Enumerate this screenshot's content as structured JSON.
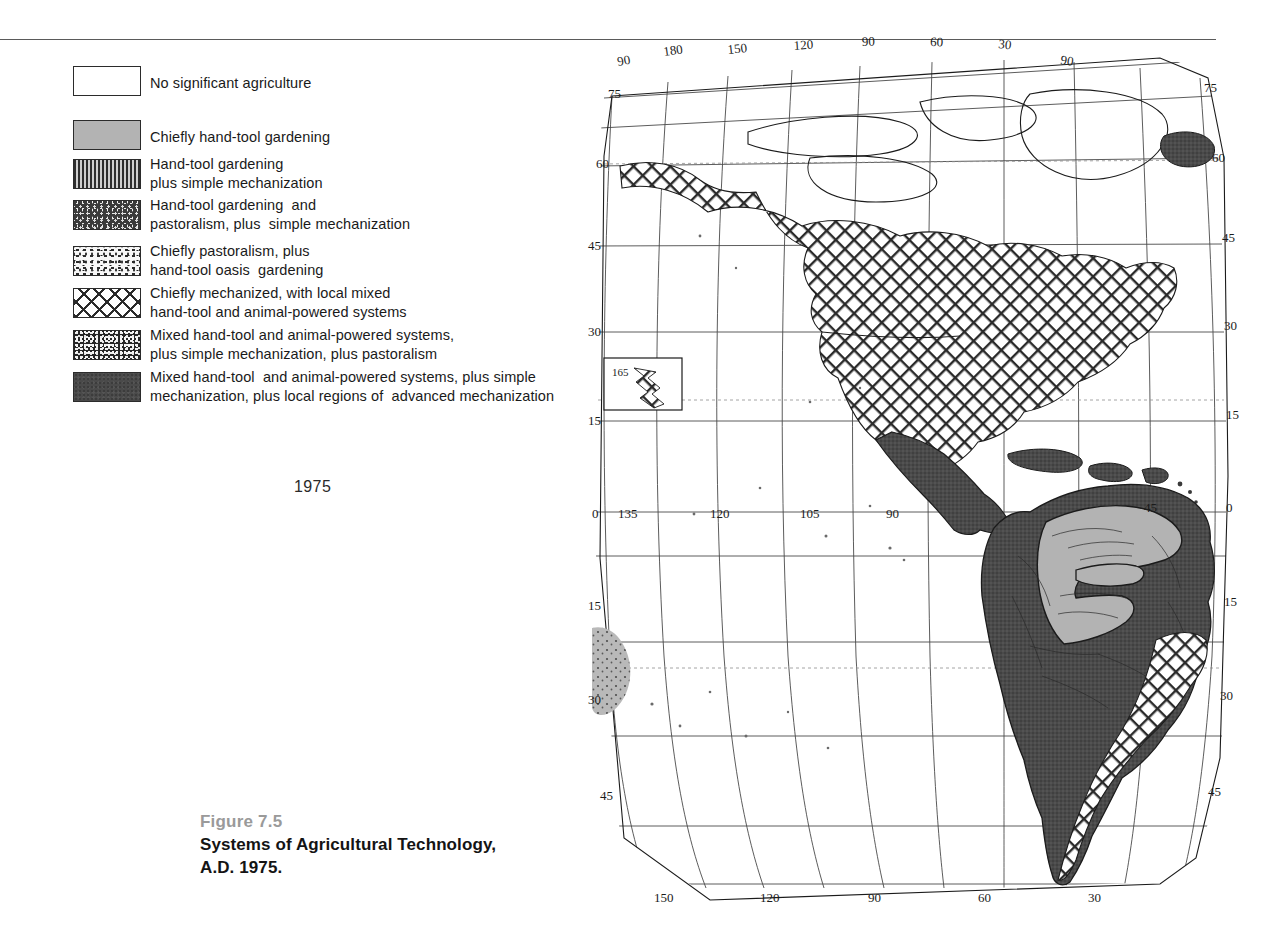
{
  "figure": {
    "number_label": "Figure 7.5",
    "title_lines": "Systems of Agricultural Technology,\nA.D. 1975.",
    "year_label": "1975"
  },
  "legend": {
    "title": "",
    "items": [
      {
        "pattern": "blank",
        "swatch_name": "legend-swatch-no-significant-agriculture",
        "label": "No significant agriculture"
      },
      {
        "pattern": "solid-gray",
        "swatch_name": "legend-swatch-chiefly-hand-tool-gardening",
        "label": "Chiefly hand-tool gardening"
      },
      {
        "pattern": "vertical-stripe",
        "swatch_name": "legend-swatch-hand-tool-plus-simple-mechanization",
        "label": "Hand-tool gardening\nplus simple mechanization"
      },
      {
        "pattern": "stipple-dark",
        "swatch_name": "legend-swatch-hand-tool-and-pastoralism",
        "label": "Hand-tool gardening  and\npastoralism, plus  simple mechanization"
      },
      {
        "pattern": "stipple-light",
        "swatch_name": "legend-swatch-chiefly-pastoralism",
        "label": "Chiefly pastoralism, plus\nhand-tool oasis  gardening"
      },
      {
        "pattern": "crosshatch",
        "swatch_name": "legend-swatch-chiefly-mechanized",
        "label": "Chiefly mechanized, with local mixed\nhand-tool and animal-powered systems"
      },
      {
        "pattern": "stipple-dense",
        "swatch_name": "legend-swatch-mixed-plus-pastoralism",
        "label": "Mixed hand-tool and animal-powered systems,\nplus simple mechanization, plus pastoralism"
      },
      {
        "pattern": "solid-dark",
        "swatch_name": "legend-swatch-mixed-plus-advanced-mechanization",
        "label": "Mixed hand-tool  and animal-powered systems, plus simple\nmechanization, plus local regions of  advanced mechanization"
      }
    ]
  },
  "map": {
    "name": "world-map-americas",
    "projection_note": "",
    "inset": {
      "name": "hawaii-inset",
      "label": "165"
    },
    "labels_top": [
      "90",
      "180",
      "150",
      "120",
      "90",
      "60",
      "30",
      "90"
    ],
    "labels_bottom": [
      "150",
      "120",
      "90",
      "60",
      "30"
    ],
    "labels_left": [
      "75",
      "60",
      "45",
      "30",
      "15",
      "0",
      "15",
      "30",
      "45"
    ],
    "labels_right": [
      "75",
      "60",
      "45",
      "30",
      "15",
      "0",
      "15",
      "30",
      "45"
    ],
    "labels_equator": [
      "135",
      "120",
      "105",
      "90",
      "45"
    ]
  },
  "colors": {
    "ink": "#1b1b1b",
    "graticule": "#4a4a4a",
    "legend_caption_gray": "#9a9a9a",
    "gray_fill": "#b3b3b3",
    "dark_fill": "#4a4a4a"
  }
}
